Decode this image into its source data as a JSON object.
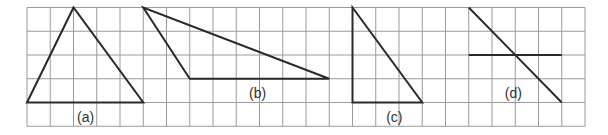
{
  "grid": {
    "origin_x": 27,
    "origin_y": 7.5,
    "cell_w": 23.25,
    "cell_h": 23.75,
    "cols": 24,
    "rows": 5,
    "line_color": "#9a9a9a",
    "shape_color": "#2a2a2a"
  },
  "figures": [
    {
      "id": "a",
      "label": "(a)",
      "type": "polygon",
      "points_grid": [
        [
          0,
          4
        ],
        [
          2,
          0
        ],
        [
          5,
          4
        ]
      ],
      "label_pos_grid": [
        2.15,
        4.6
      ]
    },
    {
      "id": "b",
      "label": "(b)",
      "type": "polygon",
      "points_grid": [
        [
          5,
          0
        ],
        [
          7,
          3
        ],
        [
          13,
          3
        ]
      ],
      "label_pos_grid": [
        9.55,
        3.6
      ]
    },
    {
      "id": "c",
      "label": "(c)",
      "type": "polygon",
      "points_grid": [
        [
          14,
          0
        ],
        [
          14,
          4
        ],
        [
          17,
          4
        ]
      ],
      "label_pos_grid": [
        15.45,
        4.6
      ]
    },
    {
      "id": "d",
      "label": "(d)",
      "type": "lines",
      "segments_grid": [
        [
          [
            19,
            0
          ],
          [
            23,
            4
          ]
        ],
        [
          [
            19,
            2
          ],
          [
            23,
            2
          ]
        ]
      ],
      "label_pos_grid": [
        20.55,
        3.6
      ]
    }
  ]
}
